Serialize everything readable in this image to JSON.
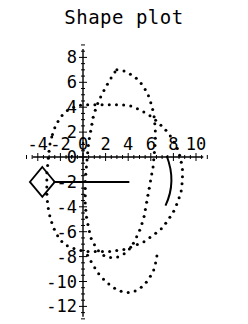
{
  "chart_data": {
    "type": "scatter",
    "title": "Shape plot",
    "xlabel": "",
    "ylabel": "",
    "xlim": [
      -5,
      11
    ],
    "ylim": [
      -13,
      9
    ],
    "grid": false,
    "legend": null,
    "xticks": [
      "-4",
      "-2",
      "0",
      "2",
      "4",
      "6",
      "8",
      "10"
    ],
    "xtick_values": [
      -4,
      -2,
      0,
      2,
      4,
      6,
      8,
      10
    ],
    "yticks": [
      "8",
      "6",
      "4",
      "2",
      "0",
      "-2",
      "-4",
      "-6",
      "-8",
      "-10",
      "-12"
    ],
    "ytick_values": [
      8,
      6,
      4,
      2,
      0,
      -2,
      -4,
      -6,
      -8,
      -10,
      -12
    ],
    "axes_origin": [
      0,
      0
    ],
    "series": [
      {
        "name": "inner-dotted-curve",
        "style": "dotted",
        "marker": "dot",
        "closed": true,
        "points": [
          [
            3.0,
            7.0
          ],
          [
            3.7,
            6.9
          ],
          [
            4.3,
            6.6
          ],
          [
            4.9,
            6.2
          ],
          [
            5.4,
            5.6
          ],
          [
            5.8,
            4.9
          ],
          [
            6.1,
            4.1
          ],
          [
            6.3,
            3.2
          ],
          [
            6.4,
            2.2
          ],
          [
            6.4,
            1.2
          ],
          [
            6.3,
            0.2
          ],
          [
            6.2,
            -0.8
          ],
          [
            6.0,
            -1.8
          ],
          [
            5.8,
            -2.8
          ],
          [
            5.6,
            -3.8
          ],
          [
            5.4,
            -4.8
          ],
          [
            5.1,
            -5.7
          ],
          [
            4.7,
            -6.5
          ],
          [
            4.3,
            -7.2
          ],
          [
            3.8,
            -7.7
          ],
          [
            3.2,
            -8.0
          ],
          [
            2.6,
            -8.1
          ],
          [
            2.0,
            -8.0
          ],
          [
            1.5,
            -7.7
          ],
          [
            1.1,
            -7.2
          ],
          [
            0.7,
            -6.5
          ],
          [
            0.5,
            -5.7
          ],
          [
            0.3,
            -4.8
          ],
          [
            0.2,
            -3.8
          ],
          [
            0.2,
            -2.8
          ],
          [
            0.2,
            -1.8
          ],
          [
            0.3,
            -0.8
          ],
          [
            0.4,
            0.2
          ],
          [
            0.5,
            1.2
          ],
          [
            0.7,
            2.2
          ],
          [
            0.9,
            3.2
          ],
          [
            1.2,
            4.1
          ],
          [
            1.6,
            4.9
          ],
          [
            2.0,
            5.6
          ],
          [
            2.4,
            6.2
          ],
          [
            2.7,
            6.7
          ]
        ]
      },
      {
        "name": "outer-dotted-curve",
        "style": "dotted",
        "marker": "dot",
        "closed": true,
        "points": [
          [
            -2.7,
            1.8
          ],
          [
            -2.4,
            2.6
          ],
          [
            -1.9,
            3.3
          ],
          [
            -1.3,
            3.8
          ],
          [
            -0.6,
            4.1
          ],
          [
            0.2,
            4.2
          ],
          [
            1.0,
            4.2
          ],
          [
            1.8,
            4.2
          ],
          [
            2.6,
            4.2
          ],
          [
            3.4,
            4.2
          ],
          [
            4.2,
            4.1
          ],
          [
            5.0,
            3.8
          ],
          [
            5.8,
            3.4
          ],
          [
            6.5,
            2.9
          ],
          [
            7.2,
            2.3
          ],
          [
            7.8,
            1.6
          ],
          [
            8.3,
            0.8
          ],
          [
            8.6,
            0.0
          ],
          [
            8.8,
            -0.9
          ],
          [
            8.8,
            -1.8
          ],
          [
            8.7,
            -2.7
          ],
          [
            8.4,
            -3.6
          ],
          [
            8.0,
            -4.4
          ],
          [
            7.5,
            -5.1
          ],
          [
            6.9,
            -5.8
          ],
          [
            6.2,
            -6.3
          ],
          [
            5.4,
            -6.8
          ],
          [
            4.6,
            -7.1
          ],
          [
            3.8,
            -7.4
          ],
          [
            3.0,
            -7.5
          ],
          [
            2.2,
            -7.6
          ],
          [
            1.4,
            -7.6
          ],
          [
            0.6,
            -7.6
          ],
          [
            -0.2,
            -7.5
          ],
          [
            -1.0,
            -7.3
          ],
          [
            -1.7,
            -7.0
          ],
          [
            -2.2,
            -6.4
          ],
          [
            -2.6,
            -5.7
          ],
          [
            -2.9,
            -4.9
          ],
          [
            -3.1,
            -4.0
          ],
          [
            -3.2,
            -3.1
          ],
          [
            -3.2,
            -2.2
          ],
          [
            -3.2,
            -1.3
          ],
          [
            -3.1,
            -0.4
          ],
          [
            -3.0,
            0.5
          ],
          [
            -2.9,
            1.2
          ]
        ]
      },
      {
        "name": "inner-lower-dotted-curve",
        "style": "dotted",
        "marker": "dot",
        "closed": false,
        "points": [
          [
            0.4,
            -7.9
          ],
          [
            0.9,
            -8.7
          ],
          [
            1.4,
            -9.4
          ],
          [
            2.0,
            -10.0
          ],
          [
            2.7,
            -10.5
          ],
          [
            3.4,
            -10.8
          ],
          [
            4.1,
            -10.9
          ],
          [
            4.8,
            -10.7
          ],
          [
            5.4,
            -10.3
          ],
          [
            5.9,
            -9.7
          ],
          [
            6.3,
            -9.0
          ],
          [
            6.5,
            -8.2
          ],
          [
            6.6,
            -7.5
          ]
        ]
      }
    ],
    "shapes": [
      {
        "name": "diamond-marker",
        "type": "diamond",
        "center": [
          -3.6,
          -2.0
        ],
        "half_width": 1.1,
        "half_height": 1.2,
        "filled": false
      },
      {
        "name": "horizontal-line-segment",
        "type": "line",
        "from": [
          -2.6,
          -2.0
        ],
        "to": [
          4.1,
          -2.0
        ]
      },
      {
        "name": "right-arc",
        "type": "arc",
        "from": [
          7.4,
          0.1
        ],
        "control": [
          8.3,
          -2.0
        ],
        "to": [
          7.3,
          -3.9
        ]
      }
    ]
  }
}
